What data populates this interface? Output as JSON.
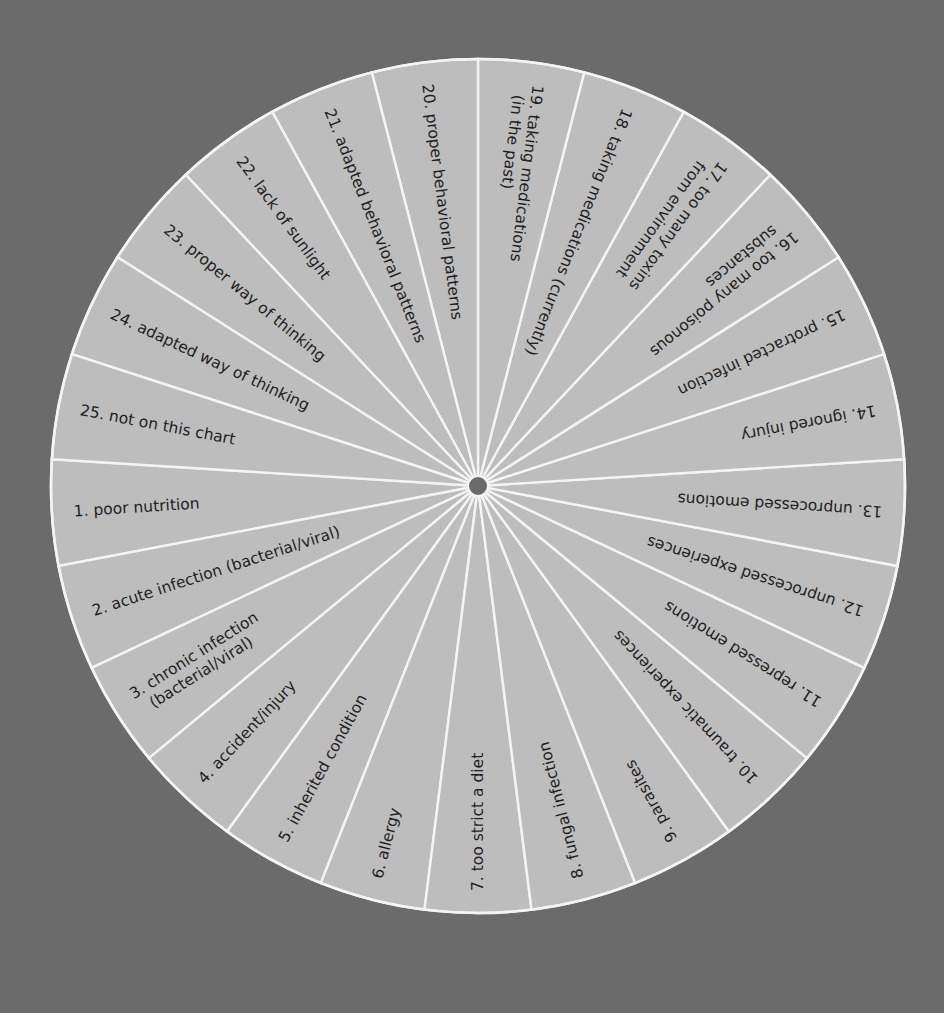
{
  "chart_data": {
    "type": "pie",
    "title": "",
    "note": "Equal-sized wheel of 25 radial segments; labels read from rim toward center",
    "start_boundary_deg_math": 90,
    "direction": "counterclockwise from top boundary starting with item 20",
    "segments": [
      {
        "n": 1,
        "lines": [
          "1.  poor nutrition"
        ]
      },
      {
        "n": 2,
        "lines": [
          "2.  acute infection (bacterial/viral)"
        ]
      },
      {
        "n": 3,
        "lines": [
          "3.  chronic infection",
          "(bacterial/viral)"
        ]
      },
      {
        "n": 4,
        "lines": [
          "4.  accident/injury"
        ]
      },
      {
        "n": 5,
        "lines": [
          "5.  inherited condition"
        ]
      },
      {
        "n": 6,
        "lines": [
          "6.  allergy"
        ]
      },
      {
        "n": 7,
        "lines": [
          "7.  too strict a diet"
        ]
      },
      {
        "n": 8,
        "lines": [
          "8.  fungal infection"
        ]
      },
      {
        "n": 9,
        "lines": [
          "9.  parasites"
        ]
      },
      {
        "n": 10,
        "lines": [
          "10.  traumatic experiences"
        ]
      },
      {
        "n": 11,
        "lines": [
          "11.  repressed emotions"
        ]
      },
      {
        "n": 12,
        "lines": [
          "12.  unprocessed experiences"
        ]
      },
      {
        "n": 13,
        "lines": [
          "13.  unprocessed emotions"
        ]
      },
      {
        "n": 14,
        "lines": [
          "14.  ignored injury"
        ]
      },
      {
        "n": 15,
        "lines": [
          "15.  protracted infection"
        ]
      },
      {
        "n": 16,
        "lines": [
          "16.  too many poisonous",
          "substances"
        ]
      },
      {
        "n": 17,
        "lines": [
          "17.  too many toxins",
          "from environment"
        ]
      },
      {
        "n": 18,
        "lines": [
          "18.  taking medications (currently)"
        ]
      },
      {
        "n": 19,
        "lines": [
          "19.  taking medications",
          "(in the past)"
        ]
      },
      {
        "n": 20,
        "lines": [
          "20.  proper behavioral patterns"
        ]
      },
      {
        "n": 21,
        "lines": [
          "21.  adapted behavioral patterns"
        ]
      },
      {
        "n": 22,
        "lines": [
          "22.  lack of sunlight"
        ]
      },
      {
        "n": 23,
        "lines": [
          "23.  proper way of thinking"
        ]
      },
      {
        "n": 24,
        "lines": [
          "24.  adapted way of thinking"
        ]
      },
      {
        "n": 25,
        "lines": [
          "25.  not on this chart"
        ]
      }
    ],
    "values": [
      1,
      1,
      1,
      1,
      1,
      1,
      1,
      1,
      1,
      1,
      1,
      1,
      1,
      1,
      1,
      1,
      1,
      1,
      1,
      1,
      1,
      1,
      1,
      1,
      1
    ]
  },
  "colors": {
    "background": "#6b6b6b",
    "segment_fill": "#bdbdbd",
    "divider": "#f4f4f4",
    "text": "#1f1f1f",
    "hub": "#6b6b6b"
  },
  "geometry": {
    "cx": 478,
    "cy": 486,
    "r": 427,
    "hub_r": 10
  }
}
